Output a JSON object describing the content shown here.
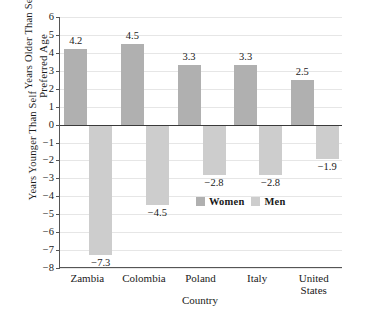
{
  "chart_data": {
    "type": "bar",
    "title": "",
    "xlabel": "Country",
    "ylabel": "Preferred Age",
    "ylabel_upper": "Years Older Than Self",
    "ylabel_lower": "Years Younger Than Self",
    "categories": [
      "Zambia",
      "Colombia",
      "Poland",
      "Italy",
      "United\nStates"
    ],
    "series": [
      {
        "name": "Women",
        "color": "#b0b0b0",
        "values": [
          4.2,
          4.5,
          3.3,
          3.3,
          2.5
        ],
        "labels": [
          "4.2",
          "4.5",
          "3.3",
          "3.3",
          "2.5"
        ]
      },
      {
        "name": "Men",
        "color": "#cdcdcd",
        "values": [
          -7.3,
          -4.5,
          -2.8,
          -2.8,
          -1.9
        ],
        "labels": [
          "−7.3",
          "−4.5",
          "−2.8",
          "−2.8",
          "−1.9"
        ]
      }
    ],
    "ylim": [
      -8,
      6
    ],
    "yticks": [
      6,
      5,
      4,
      3,
      2,
      1,
      0,
      -1,
      -2,
      -3,
      -4,
      -5,
      -6,
      -7,
      -8
    ],
    "ytick_labels": [
      "6",
      "5",
      "4",
      "3",
      "2",
      "1",
      "0",
      "−1",
      "−2",
      "−3",
      "−4",
      "−5",
      "−6",
      "−7",
      "−8"
    ],
    "grid": true,
    "legend_position": "inside-lower-right",
    "legend_entries": [
      "Women",
      "Men"
    ]
  }
}
